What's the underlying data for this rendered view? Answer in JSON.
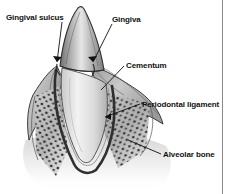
{
  "figure": {
    "style": "grayscale pen-and-ink anatomical illustration",
    "background_color": "#ffffff",
    "ink_color": "#111111",
    "border": {
      "right_rule_color": "#8a8a8a",
      "right_rule_x": 222
    }
  },
  "labels": {
    "gingival_sulcus": "Gingival sulcus",
    "gingiva": "Gingiva",
    "cementum": "Cementum",
    "periodontal_ligament": "Periodontal ligament",
    "alveolar_bone": "Alveolar bone"
  },
  "callouts": [
    {
      "name": "gingival-sulcus",
      "label": "Gingival sulcus",
      "text_x": 6,
      "text_y": 13,
      "leader_from": [
        62,
        22
      ],
      "leader_to": [
        57,
        64
      ],
      "arrow": true
    },
    {
      "name": "gingiva",
      "label": "Gingiva",
      "text_x": 112,
      "text_y": 15,
      "leader_from": [
        112,
        24
      ],
      "leader_to": [
        92,
        64
      ],
      "arrow": true
    },
    {
      "name": "cementum",
      "label": "Cementum",
      "text_x": 126,
      "text_y": 61,
      "leader_from": [
        124,
        66
      ],
      "leader_to": [
        101,
        90
      ],
      "arrow": false
    },
    {
      "name": "periodontal-ligament",
      "label": "Periodontal ligament",
      "text_x": 142,
      "text_y": 100,
      "leader_from": [
        140,
        104
      ],
      "leader_to": [
        104,
        117
      ],
      "arrow": true
    },
    {
      "name": "alveolar-bone",
      "label": "Alveolar bone",
      "text_x": 163,
      "text_y": 150,
      "leader_from": [
        161,
        154
      ],
      "leader_to": [
        128,
        140
      ],
      "arrow": false
    }
  ],
  "structures": [
    {
      "name": "crown",
      "description": "pointed canine crown, enamel, shaded gradient gray"
    },
    {
      "name": "root",
      "description": "long tapering root, light gray dentin"
    },
    {
      "name": "gingiva-left",
      "description": "gum wedge sloping down-left from tooth neck"
    },
    {
      "name": "gingiva-right",
      "description": "gum wedge sloping down-right from tooth neck"
    },
    {
      "name": "alveolar-bone-left",
      "description": "stippled trabecular bone, left socket wall"
    },
    {
      "name": "alveolar-bone-right",
      "description": "stippled trabecular bone, right socket wall"
    },
    {
      "name": "periodontal-ligament-space",
      "description": "dark narrow band lining the socket around the root"
    }
  ]
}
